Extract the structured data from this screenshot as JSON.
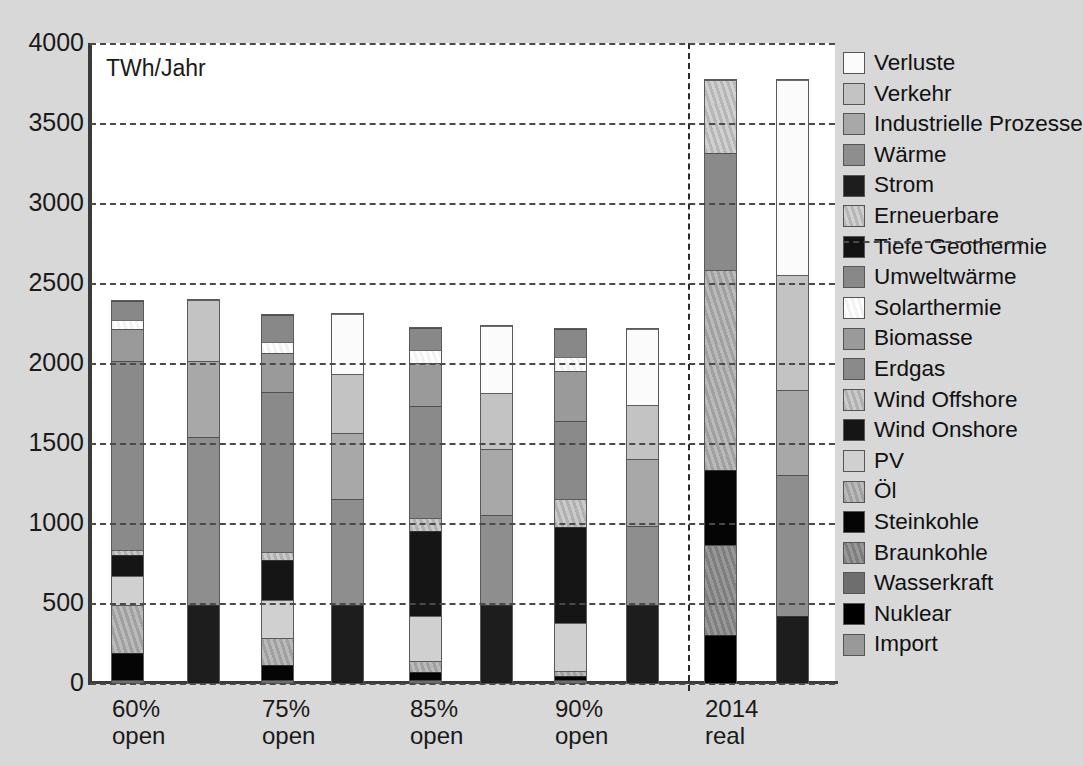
{
  "chart_data": {
    "type": "bar",
    "title": "",
    "subtitle": "",
    "unit_label": "TWh/Jahr",
    "xlabel": "",
    "ylabel": "TWh/Jahr",
    "ylim": [
      0,
      4000
    ],
    "ytick_step": 500,
    "yticks": [
      "4000",
      "3500",
      "3000",
      "2500",
      "2000",
      "1500",
      "1000",
      "500",
      "0"
    ],
    "grid": true,
    "grid_style": "dashed-horizontal",
    "legend_position": "right",
    "stacked": true,
    "paired_bars": true,
    "divider_after_group": 4,
    "categories": [
      "60%\nopen",
      "75%\nopen",
      "85%\nopen",
      "90%\nopen",
      "2014\nreal"
    ],
    "group_labels": [
      {
        "line1": "60%",
        "line2": "open"
      },
      {
        "line1": "75%",
        "line2": "open"
      },
      {
        "line1": "85%",
        "line2": "open"
      },
      {
        "line1": "90%",
        "line2": "open"
      },
      {
        "line1": "2014",
        "line2": "real"
      }
    ],
    "legend_entries": [
      {
        "label": "Verluste",
        "color": "#fbfbfb",
        "pattern": "solid"
      },
      {
        "label": "Verkehr",
        "color": "#c3c3c3",
        "pattern": "solid"
      },
      {
        "label": "Industrielle Prozesse",
        "color": "#a8a8a8",
        "pattern": "solid"
      },
      {
        "label": "Wärme",
        "color": "#8e8e8e",
        "pattern": "solid"
      },
      {
        "label": "Strom",
        "color": "#1d1d1d",
        "pattern": "solid"
      },
      {
        "label": "Erneuerbare",
        "color": "#b6b6b6",
        "pattern": "hatch"
      },
      {
        "label": "Tiefe Geothermie",
        "color": "#131313",
        "pattern": "solid"
      },
      {
        "label": "Umweltwärme",
        "color": "#888888",
        "pattern": "solid"
      },
      {
        "label": "Solarthermie",
        "color": "#f2f2f2",
        "pattern": "hatch"
      },
      {
        "label": "Biomasse",
        "color": "#9a9a9a",
        "pattern": "solid"
      },
      {
        "label": "Erdgas",
        "color": "#8a8a8a",
        "pattern": "solid"
      },
      {
        "label": "Wind Offshore",
        "color": "#b0b0b0",
        "pattern": "hatch"
      },
      {
        "label": "Wind Onshore",
        "color": "#151515",
        "pattern": "solid"
      },
      {
        "label": "PV",
        "color": "#d0d0d0",
        "pattern": "solid"
      },
      {
        "label": "Öl",
        "color": "#a0a0a0",
        "pattern": "hatch"
      },
      {
        "label": "Steinkohle",
        "color": "#050505",
        "pattern": "solid"
      },
      {
        "label": "Braunkohle",
        "color": "#7e7e7e",
        "pattern": "hatch"
      },
      {
        "label": "Wasserkraft",
        "color": "#6e6e6e",
        "pattern": "solid"
      },
      {
        "label": "Nuklear",
        "color": "#000000",
        "pattern": "solid"
      },
      {
        "label": "Import",
        "color": "#999999",
        "pattern": "solid"
      }
    ],
    "legend_divider_after": "Erneuerbare",
    "bars": [
      {
        "group": "60% open",
        "side": "supply",
        "total": 2390,
        "segments": [
          {
            "name": "Wasserkraft",
            "value": 20
          },
          {
            "name": "Steinkohle",
            "value": 170
          },
          {
            "name": "Öl",
            "value": 300
          },
          {
            "name": "PV",
            "value": 180
          },
          {
            "name": "Wind Onshore",
            "value": 130
          },
          {
            "name": "Wind Offshore",
            "value": 30
          },
          {
            "name": "Erdgas",
            "value": 1180
          },
          {
            "name": "Biomasse",
            "value": 200
          },
          {
            "name": "Solarthermie",
            "value": 60
          },
          {
            "name": "Umweltwärme",
            "value": 120
          }
        ]
      },
      {
        "group": "60% open",
        "side": "demand",
        "total": 2395,
        "segments": [
          {
            "name": "Strom",
            "value": 490
          },
          {
            "name": "Wärme",
            "value": 1045
          },
          {
            "name": "Industrielle Prozesse",
            "value": 475
          },
          {
            "name": "Verkehr",
            "value": 385
          }
        ]
      },
      {
        "group": "75% open",
        "side": "supply",
        "total": 2300,
        "segments": [
          {
            "name": "Wasserkraft",
            "value": 20
          },
          {
            "name": "Steinkohle",
            "value": 90
          },
          {
            "name": "Öl",
            "value": 170
          },
          {
            "name": "PV",
            "value": 240
          },
          {
            "name": "Wind Onshore",
            "value": 250
          },
          {
            "name": "Wind Offshore",
            "value": 50
          },
          {
            "name": "Erdgas",
            "value": 1000
          },
          {
            "name": "Biomasse",
            "value": 240
          },
          {
            "name": "Solarthermie",
            "value": 70
          },
          {
            "name": "Umweltwärme",
            "value": 170
          }
        ]
      },
      {
        "group": "75% open",
        "side": "demand",
        "total": 2305,
        "segments": [
          {
            "name": "Strom",
            "value": 490
          },
          {
            "name": "Wärme",
            "value": 660
          },
          {
            "name": "Industrielle Prozesse",
            "value": 410
          },
          {
            "name": "Verkehr",
            "value": 370
          },
          {
            "name": "Verluste",
            "value": 375
          }
        ]
      },
      {
        "group": "85% open",
        "side": "supply",
        "total": 2220,
        "segments": [
          {
            "name": "Wasserkraft",
            "value": 20
          },
          {
            "name": "Steinkohle",
            "value": 50
          },
          {
            "name": "Öl",
            "value": 65
          },
          {
            "name": "PV",
            "value": 285
          },
          {
            "name": "Wind Onshore",
            "value": 530
          },
          {
            "name": "Wind Offshore",
            "value": 80
          },
          {
            "name": "Erdgas",
            "value": 700
          },
          {
            "name": "Biomasse",
            "value": 270
          },
          {
            "name": "Solarthermie",
            "value": 80
          },
          {
            "name": "Umweltwärme",
            "value": 140
          }
        ]
      },
      {
        "group": "85% open",
        "side": "demand",
        "total": 2230,
        "segments": [
          {
            "name": "Strom",
            "value": 490
          },
          {
            "name": "Wärme",
            "value": 560
          },
          {
            "name": "Industrielle Prozesse",
            "value": 415
          },
          {
            "name": "Verkehr",
            "value": 345
          },
          {
            "name": "Verluste",
            "value": 420
          }
        ]
      },
      {
        "group": "90% open",
        "side": "supply",
        "total": 2215,
        "segments": [
          {
            "name": "Wasserkraft",
            "value": 20
          },
          {
            "name": "Steinkohle",
            "value": 25
          },
          {
            "name": "Öl",
            "value": 30
          },
          {
            "name": "PV",
            "value": 300
          },
          {
            "name": "Wind Onshore",
            "value": 600
          },
          {
            "name": "Wind Offshore",
            "value": 175
          },
          {
            "name": "Erdgas",
            "value": 490
          },
          {
            "name": "Biomasse",
            "value": 310
          },
          {
            "name": "Solarthermie",
            "value": 85
          },
          {
            "name": "Umweltwärme",
            "value": 180
          }
        ]
      },
      {
        "group": "90% open",
        "side": "demand",
        "total": 2215,
        "segments": [
          {
            "name": "Strom",
            "value": 490
          },
          {
            "name": "Wärme",
            "value": 490
          },
          {
            "name": "Industrielle Prozesse",
            "value": 420
          },
          {
            "name": "Verkehr",
            "value": 335
          },
          {
            "name": "Verluste",
            "value": 480
          }
        ]
      },
      {
        "group": "2014 real",
        "side": "supply",
        "total": 3770,
        "segments": [
          {
            "name": "Nuklear",
            "value": 300
          },
          {
            "name": "Braunkohle",
            "value": 565
          },
          {
            "name": "Steinkohle",
            "value": 465
          },
          {
            "name": "Öl",
            "value": 1250
          },
          {
            "name": "Erdgas",
            "value": 730
          },
          {
            "name": "Erneuerbare",
            "value": 460
          }
        ]
      },
      {
        "group": "2014 real",
        "side": "demand",
        "total": 3770,
        "segments": [
          {
            "name": "Strom",
            "value": 420
          },
          {
            "name": "Wärme",
            "value": 880
          },
          {
            "name": "Industrielle Prozesse",
            "value": 530
          },
          {
            "name": "Verkehr",
            "value": 720
          },
          {
            "name": "Verluste",
            "value": 1220
          }
        ]
      }
    ]
  },
  "axis": {
    "unit_label": "TWh/Jahr"
  }
}
